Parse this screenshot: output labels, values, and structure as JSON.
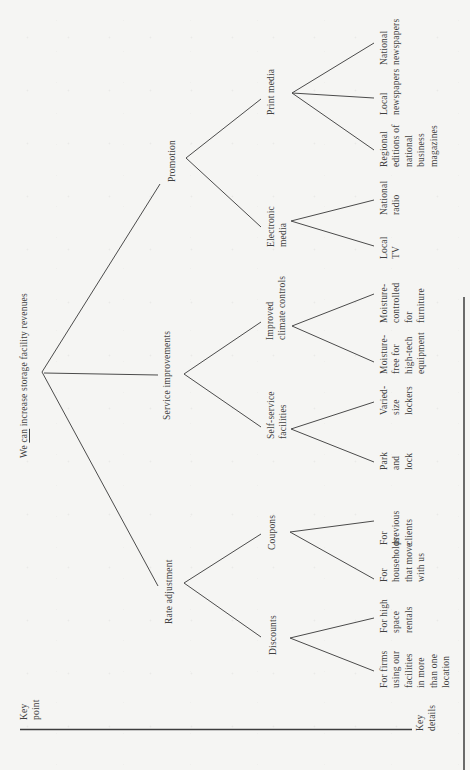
{
  "figure": {
    "key_point_label": "Key\npoint",
    "key_details_label": "Key\ndetails",
    "root": {
      "pre": "We ",
      "emph": "can",
      "post": " increase storage facility revenues"
    },
    "branches": [
      {
        "label": "Rate adjustment",
        "children": [
          {
            "label": "Discounts",
            "leaves": [
              "For firms\nusing our\nfacilities\nin more\nthan one\nlocation",
              "For high\nspace\nrentals"
            ]
          },
          {
            "label": "Coupons",
            "leaves": [
              "For\nhouseholds\nthat move\nwith us",
              "For\nprevious\nclients"
            ]
          }
        ]
      },
      {
        "label": "Service improvements",
        "children": [
          {
            "label": "Self-service\nfacilities",
            "leaves": [
              "Park\nand\nlock",
              "Varied-\nsize\nlockers"
            ]
          },
          {
            "label": "Improved\nclimate controls",
            "leaves": [
              "Moisture-\nfree for\nhigh-tech\nequipment",
              "Moisture-\ncontrolled\nfor\nfurniture"
            ]
          }
        ]
      },
      {
        "label": "Promotion",
        "children": [
          {
            "label": "Electronic\nmedia",
            "leaves": [
              "Local\nTV",
              "National\nradio"
            ]
          },
          {
            "label": "Print media",
            "leaves": [
              "Regional\neditions of\nnational\nbusiness\nmagazines",
              "Local\nnewspapers",
              "National\nnewspapers"
            ]
          }
        ]
      }
    ]
  },
  "colors": {
    "paper": "#f5f5f3",
    "ink": "#3f3f3f",
    "line": "#4b4b4b",
    "rule": "#3d3d3d"
  }
}
